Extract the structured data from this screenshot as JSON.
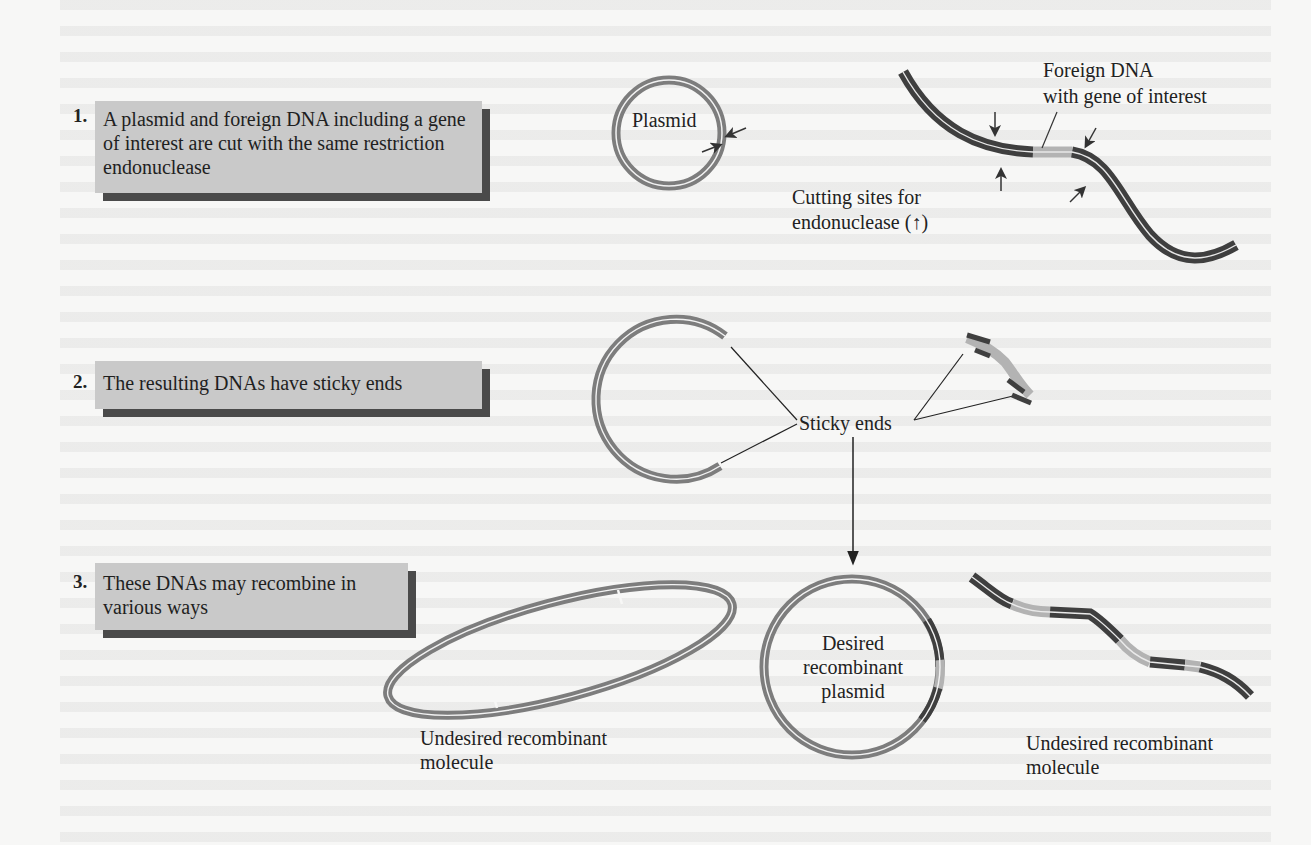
{
  "steps": [
    {
      "number": "1.",
      "text": "A plasmid and foreign DNA including a gene of interest are cut with the same restriction endonuclease"
    },
    {
      "number": "2.",
      "text": "The resulting DNAs have sticky ends"
    },
    {
      "number": "3.",
      "text": "These DNAs may recombine in various ways"
    }
  ],
  "labels": {
    "plasmid": "Plasmid",
    "foreign_dna_line1": "Foreign DNA",
    "foreign_dna_line2": "with gene of interest",
    "cutting_sites_line1": "Cutting sites for",
    "cutting_sites_line2": "endonuclease (↑)",
    "sticky_ends": "Sticky ends",
    "desired_line1": "Desired",
    "desired_line2": "recombinant",
    "desired_line3": "plasmid",
    "undesired_left_line1": "Undesired recombinant",
    "undesired_left_line2": "molecule",
    "undesired_right_line1": "Undesired recombinant",
    "undesired_right_line2": "molecule"
  },
  "colors": {
    "step_box": "#c9c9c9",
    "step_shadow": "#4a4a4a",
    "plasmid_dna": "#7d7d7d",
    "foreign_dna": "#3f3f3f",
    "gene_of_interest": "#b3b3b3",
    "arrow": "#222222"
  }
}
